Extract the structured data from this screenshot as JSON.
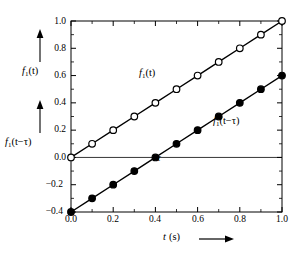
{
  "chart_data": {
    "type": "line",
    "title": "",
    "xlabel": "t (s)",
    "ylabel_top": "f1(t)",
    "ylabel_bottom": "f1(t - tau)",
    "xlim": [
      0.0,
      1.0
    ],
    "ylim": [
      -0.4,
      1.0
    ],
    "x_major_step": 0.2,
    "y_major_step": 0.2,
    "x_minor_step": 0.1,
    "y_minor_step": 0.1,
    "grid": false,
    "legend": "inline-annotations",
    "x": [
      0.0,
      0.1,
      0.2,
      0.3,
      0.4,
      0.5,
      0.6,
      0.7,
      0.8,
      0.9,
      1.0
    ],
    "series": [
      {
        "name": "f1(t)",
        "marker": "open-circle",
        "values": [
          0.0,
          0.1,
          0.2,
          0.3,
          0.4,
          0.5,
          0.6,
          0.7,
          0.8,
          0.9,
          1.0
        ]
      },
      {
        "name": "f1(t - tau)",
        "marker": "filled-circle",
        "values": [
          -0.4,
          -0.3,
          -0.2,
          -0.1,
          0.0,
          0.1,
          0.2,
          0.3,
          0.4,
          0.5,
          0.6
        ]
      }
    ],
    "zero_line": 0.0,
    "tau_value": 0.4,
    "xticklabels": [
      "0.0",
      "0.2",
      "0.4",
      "0.6",
      "0.8",
      "1.0"
    ],
    "xtickvalues": [
      0.0,
      0.2,
      0.4,
      0.6,
      0.8,
      1.0
    ],
    "yticklabels": [
      "1.0",
      "0.8",
      "0.6",
      "0.4",
      "0.2",
      "0.0",
      "−0.2",
      "−0.4"
    ],
    "ytickvalues": [
      1.0,
      0.8,
      0.6,
      0.4,
      0.2,
      0.0,
      -0.2,
      -0.4
    ],
    "annotations": [
      {
        "name": "tau",
        "text": "τ",
        "x": 0.4,
        "y": 0.0
      },
      {
        "name": "curve-label-upper",
        "text": "f1(t)",
        "x": 0.33,
        "y": 0.56
      },
      {
        "name": "curve-label-lower",
        "text": "f1(t - tau)",
        "x": 0.7,
        "y": 0.3
      }
    ],
    "colors": {
      "line": "#000000",
      "frame": "#000000",
      "marker_face_open": "#ffffff",
      "marker_face_filled": "#000000",
      "background": "#ffffff"
    }
  },
  "labels": {
    "f1_t_base": "f",
    "f1_sub": "1",
    "f1_t_arg": "(t)",
    "f1_tau_arg": "(t−τ)",
    "tau_symbol": "τ",
    "x_axis_var": "t",
    "x_axis_unit": "(s)",
    "y_top": "f",
    "y_bottom": "f"
  },
  "ticks": {
    "y": [
      "1.0",
      "0.8",
      "0.6",
      "0.4",
      "0.2",
      "0.0",
      "−0.2",
      "−0.4"
    ],
    "x": [
      "0.0",
      "0.2",
      "0.4",
      "0.6",
      "0.8",
      "1.0"
    ]
  }
}
